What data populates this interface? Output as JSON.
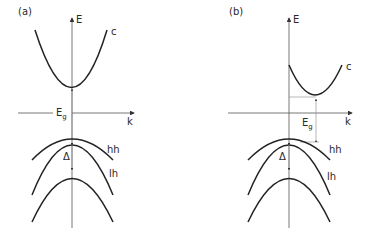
{
  "panels": [
    {
      "id": "a",
      "label": "(a)",
      "type": "direct-gap",
      "axis_y_label": "E",
      "axis_x_label": "k",
      "gap_label": "E",
      "gap_sub": "g",
      "bands": {
        "conduction": "c",
        "heavy_hole": "hh",
        "light_hole": "lh"
      },
      "split_label": "Δ"
    },
    {
      "id": "b",
      "label": "(b)",
      "type": "indirect-gap",
      "axis_y_label": "E",
      "axis_x_label": "k",
      "gap_label": "E",
      "gap_sub": "g",
      "bands": {
        "conduction": "c",
        "heavy_hole": "hh",
        "light_hole": "lh"
      },
      "split_label": "Δ"
    }
  ]
}
